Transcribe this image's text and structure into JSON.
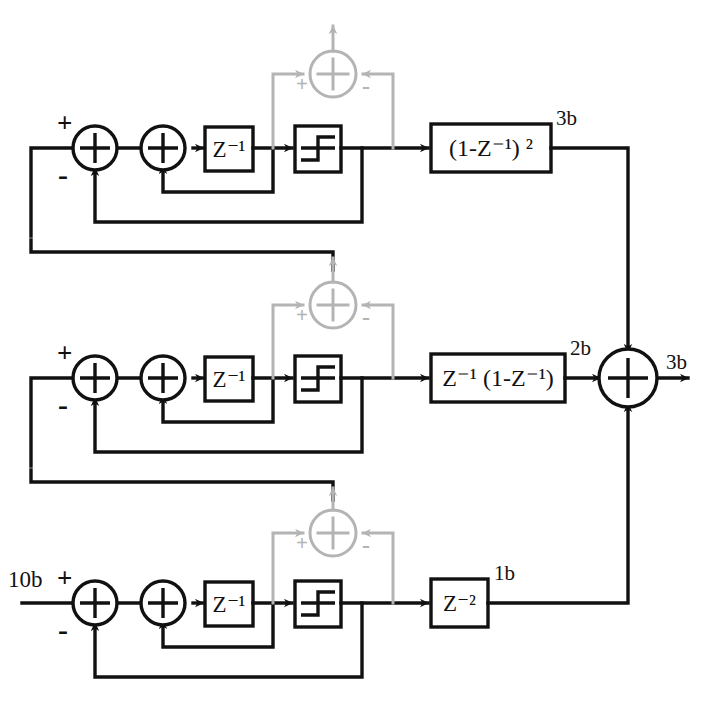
{
  "diagram": {
    "input_label": "10b",
    "output_label": "3b",
    "colors": {
      "line": "#111111",
      "ghost_line": "#b4b4b4",
      "background": "#ffffff"
    },
    "signs": {
      "plus": "+",
      "minus": "-"
    },
    "stages": [
      {
        "name": "stage-1-top",
        "delay_label": "Z⁻¹",
        "quantizer_label": "quantizer-step-icon",
        "noise_cancel_label": "(1-Z⁻¹) ²",
        "bit_label": "3b",
        "sum_signs": [
          "+",
          "-"
        ]
      },
      {
        "name": "stage-2-middle",
        "delay_label": "Z⁻¹",
        "quantizer_label": "quantizer-step-icon",
        "noise_cancel_label": "Z⁻¹ (1-Z⁻¹)",
        "bit_label": "2b",
        "sum_signs": [
          "+",
          "-"
        ]
      },
      {
        "name": "stage-3-bottom",
        "delay_label": "Z⁻¹",
        "quantizer_label": "quantizer-step-icon",
        "noise_cancel_label": "Z⁻²",
        "bit_label": "1b",
        "sum_signs": [
          "+",
          "-"
        ]
      }
    ],
    "final_sum": {
      "name": "output-summer",
      "output_label": "3b"
    },
    "ghost_summers": [
      {
        "name": "ghost-summer-top",
        "plus": "+",
        "minus": "-"
      },
      {
        "name": "ghost-summer-middle",
        "plus": "+",
        "minus": "-"
      },
      {
        "name": "ghost-summer-bottom",
        "plus": "+",
        "minus": "-"
      }
    ]
  }
}
